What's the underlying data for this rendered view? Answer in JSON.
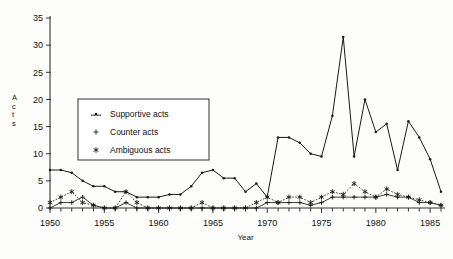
{
  "chart_data": {
    "type": "line",
    "title": "",
    "xlabel": "Year",
    "ylabel": "Acts",
    "xlim": [
      1950,
      1986
    ],
    "ylim": [
      0,
      35
    ],
    "ytick_values": [
      0,
      5,
      10,
      15,
      20,
      25,
      30,
      35
    ],
    "ytick_labels": [
      "0",
      "5",
      "10",
      "15",
      "20",
      "25",
      "30",
      "35"
    ],
    "xtick_values": [
      1950,
      1955,
      1960,
      1965,
      1970,
      1975,
      1980,
      1985
    ],
    "xtick_labels": [
      "1950",
      "1955",
      "1960",
      "1965",
      "1970",
      "1975",
      "1980",
      "1985"
    ],
    "minor_xticks": true,
    "grid": false,
    "legend_position": "upper-left-inset",
    "x": [
      1950,
      1951,
      1952,
      1953,
      1954,
      1955,
      1956,
      1957,
      1958,
      1959,
      1960,
      1961,
      1962,
      1963,
      1964,
      1965,
      1966,
      1967,
      1968,
      1969,
      1970,
      1971,
      1972,
      1973,
      1974,
      1975,
      1976,
      1977,
      1978,
      1979,
      1980,
      1981,
      1982,
      1983,
      1984,
      1985,
      1986
    ],
    "series": [
      {
        "name": "Supportive acts",
        "marker": "dot-line",
        "linestyle": "solid",
        "color": "#1a1a1a",
        "values": [
          7,
          7,
          6.5,
          5,
          4,
          4,
          3,
          3,
          2,
          2,
          2,
          2.5,
          2.5,
          4,
          6.5,
          7,
          5.5,
          5.5,
          3,
          4.5,
          2,
          13,
          13,
          12,
          10,
          9.5,
          17,
          31.5,
          9.5,
          20,
          14,
          15.5,
          7,
          16,
          13,
          9,
          3
        ]
      },
      {
        "name": "Counter acts",
        "marker": "plus",
        "linestyle": "solid",
        "color": "#1a1a1a",
        "values": [
          0,
          1,
          1,
          2,
          0.5,
          0,
          0,
          1,
          0,
          0,
          0,
          0,
          0,
          0,
          0,
          0,
          0,
          0,
          0,
          0,
          1,
          1,
          1,
          1,
          0.5,
          1,
          2,
          2,
          2,
          2,
          2,
          2.5,
          2,
          2,
          1,
          1,
          0.5
        ]
      },
      {
        "name": "Ambiguous acts",
        "marker": "asterisk",
        "linestyle": "dotted",
        "color": "#1a1a1a",
        "values": [
          1,
          2,
          3,
          1,
          0.5,
          0,
          0,
          3,
          1,
          0,
          0,
          0,
          0,
          0,
          1,
          0,
          0,
          0,
          0,
          1,
          2,
          1,
          2,
          2,
          1,
          2,
          3,
          2.5,
          4.5,
          3,
          2,
          3.5,
          2.5,
          2,
          1.5,
          1,
          0.5
        ]
      }
    ]
  },
  "legend": {
    "items": [
      {
        "label": "Supportive acts",
        "marker": "dot-line"
      },
      {
        "label": "Counter acts",
        "marker": "plus"
      },
      {
        "label": "Ambiguous acts",
        "marker": "asterisk"
      }
    ]
  },
  "axes": {
    "y_label_chars": [
      "A",
      "c",
      "t",
      "s"
    ],
    "x_title": "Year"
  }
}
